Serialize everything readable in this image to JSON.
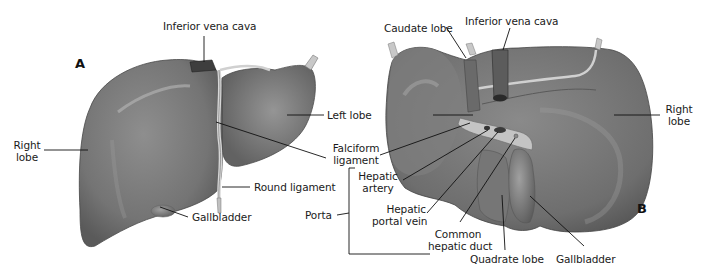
{
  "diagram": {
    "colors": {
      "background": "#ffffff",
      "liver_fill": "#7a7a7a",
      "liver_shadow": "#555555",
      "liver_highlight": "#a8a8a8",
      "leader_line": "#111111",
      "text": "#1a1a1a"
    },
    "panels": {
      "a": {
        "letter": "A"
      },
      "b": {
        "letter": "B"
      }
    },
    "labels_a": {
      "inferior_vena_cava": "Inferior vena cava",
      "right_lobe_1": "Right",
      "right_lobe_2": "lobe",
      "left_lobe": "Left lobe",
      "falciform_1": "Falciform",
      "falciform_2": "ligament",
      "round_ligament": "Round ligament",
      "gallbladder": "Gallbladder"
    },
    "labels_b": {
      "caudate_lobe": "Caudate lobe",
      "inferior_vena_cava": "Inferior vena cava",
      "right_lobe_1": "Right",
      "right_lobe_2": "lobe",
      "hepatic_artery_1": "Hepatic",
      "hepatic_artery_2": "artery",
      "hepatic_portal_vein_1": "Hepatic",
      "hepatic_portal_vein_2": "portal vein",
      "common_hepatic_duct_1": "Common",
      "common_hepatic_duct_2": "hepatic duct",
      "quadrate_lobe": "Quadrate lobe",
      "gallbladder": "Gallbladder"
    },
    "porta": {
      "label": "Porta"
    }
  }
}
